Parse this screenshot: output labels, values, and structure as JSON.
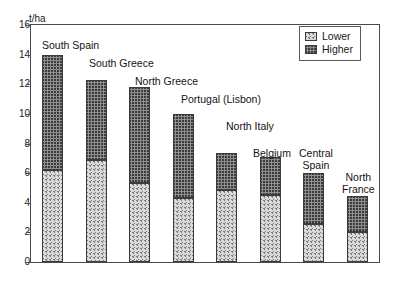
{
  "chart_data": {
    "type": "bar",
    "subtype": "stacked-bar",
    "title": "",
    "xlabel": "",
    "ylabel": "t/ha",
    "ylim": [
      0,
      16
    ],
    "ytick_step": 2,
    "yticks": [
      16,
      14,
      12,
      10,
      8,
      6,
      4,
      2,
      0
    ],
    "grid": false,
    "legend_position": "top-right",
    "categories": [
      "South Spain",
      "South Greece",
      "North Greece",
      "Portugal (Lisbon)",
      "North Italy",
      "Belgium",
      "Central Spain",
      "North France"
    ],
    "series": [
      {
        "name": "Lower",
        "values": [
          6.2,
          6.9,
          5.35,
          4.3,
          4.85,
          4.55,
          2.6,
          2.05
        ]
      },
      {
        "name": "Higher",
        "values": [
          7.8,
          5.4,
          6.45,
          5.7,
          2.5,
          2.55,
          3.4,
          2.4
        ]
      }
    ],
    "totals": [
      14.0,
      12.3,
      11.8,
      10.0,
      7.35,
      7.1,
      6.0,
      4.45
    ]
  },
  "axis": {
    "unit_label": "t/ha"
  },
  "legend": {
    "items": [
      {
        "label": "Lower",
        "swatch": "light-diagonal-hatch-swatch"
      },
      {
        "label": "Higher",
        "swatch": "dark-crosshatch-swatch"
      }
    ]
  },
  "bar_labels": [
    {
      "text": "South Spain"
    },
    {
      "text": "South Greece"
    },
    {
      "text": "North Greece"
    },
    {
      "text": "Portugal (Lisbon)"
    },
    {
      "text": "North Italy"
    },
    {
      "text": "Belgium"
    },
    {
      "text": "Central\nSpain"
    },
    {
      "text": "North\nFrance"
    }
  ],
  "colors": {
    "frame": "#4a4a4a",
    "text": "#141414",
    "lower_fill": "#d9d9d9",
    "higher_fill": "#8f8f8f",
    "background": "#ffffff"
  }
}
